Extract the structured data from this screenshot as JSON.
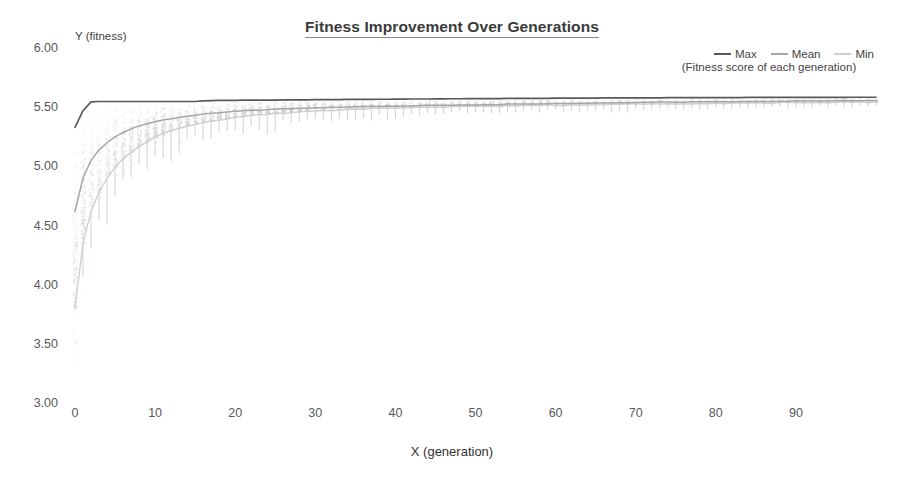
{
  "chart_data": {
    "type": "line",
    "title": "Fitness Improvement Over Generations",
    "subtitle": "(Fitness score of each generation)",
    "xlabel": "X (generation)",
    "ylabel": "Y (fitness)",
    "xlim": [
      0,
      100
    ],
    "ylim": [
      3.0,
      6.0
    ],
    "grid": false,
    "legend_position": "top-right",
    "yticks": [
      "6.00",
      "5.50",
      "5.00",
      "4.50",
      "4.00",
      "3.50",
      "3.00"
    ],
    "ytick_values": [
      6.0,
      5.5,
      5.0,
      4.5,
      4.0,
      3.5,
      3.0
    ],
    "xticks": [
      "0",
      "10",
      "20",
      "30",
      "40",
      "50",
      "60",
      "70",
      "80",
      "90"
    ],
    "xtick_values": [
      0,
      10,
      20,
      30,
      40,
      50,
      60,
      70,
      80,
      90
    ],
    "colors": {
      "max": "#595959",
      "mean": "#a6a6a6",
      "min": "#cfcfcf"
    },
    "x": [
      0,
      1,
      2,
      3,
      4,
      5,
      6,
      7,
      8,
      9,
      10,
      11,
      12,
      13,
      14,
      15,
      16,
      17,
      18,
      19,
      20,
      21,
      22,
      23,
      24,
      25,
      26,
      27,
      28,
      29,
      30,
      31,
      32,
      33,
      34,
      35,
      36,
      37,
      38,
      39,
      40,
      41,
      42,
      43,
      44,
      45,
      46,
      47,
      48,
      49,
      50,
      51,
      52,
      53,
      54,
      55,
      56,
      57,
      58,
      59,
      60,
      61,
      62,
      63,
      64,
      65,
      66,
      67,
      68,
      69,
      70,
      71,
      72,
      73,
      74,
      75,
      76,
      77,
      78,
      79,
      80,
      81,
      82,
      83,
      84,
      85,
      86,
      87,
      88,
      89,
      90,
      91,
      92,
      93,
      94,
      95,
      96,
      97,
      98,
      99,
      100
    ],
    "series": [
      {
        "name": "Max",
        "color": "#595959",
        "values": [
          5.33,
          5.47,
          5.545,
          5.548,
          5.548,
          5.548,
          5.548,
          5.548,
          5.548,
          5.548,
          5.548,
          5.548,
          5.548,
          5.548,
          5.548,
          5.548,
          5.553,
          5.556,
          5.558,
          5.558,
          5.558,
          5.559,
          5.559,
          5.559,
          5.56,
          5.56,
          5.561,
          5.561,
          5.562,
          5.562,
          5.563,
          5.563,
          5.564,
          5.564,
          5.565,
          5.565,
          5.566,
          5.566,
          5.567,
          5.567,
          5.568,
          5.568,
          5.569,
          5.569,
          5.569,
          5.57,
          5.57,
          5.571,
          5.571,
          5.572,
          5.572,
          5.572,
          5.573,
          5.573,
          5.574,
          5.574,
          5.574,
          5.575,
          5.575,
          5.575,
          5.576,
          5.576,
          5.576,
          5.577,
          5.577,
          5.577,
          5.578,
          5.578,
          5.578,
          5.578,
          5.579,
          5.579,
          5.579,
          5.579,
          5.58,
          5.58,
          5.58,
          5.58,
          5.58,
          5.581,
          5.581,
          5.581,
          5.581,
          5.581,
          5.582,
          5.582,
          5.582,
          5.582,
          5.582,
          5.582,
          5.583,
          5.583,
          5.583,
          5.583,
          5.583,
          5.583,
          5.583,
          5.584,
          5.584,
          5.584,
          5.584
        ]
      },
      {
        "name": "Mean",
        "color": "#a6a6a6",
        "values": [
          4.62,
          4.9,
          5.05,
          5.14,
          5.2,
          5.25,
          5.285,
          5.315,
          5.34,
          5.36,
          5.375,
          5.39,
          5.403,
          5.414,
          5.424,
          5.433,
          5.441,
          5.448,
          5.454,
          5.459,
          5.464,
          5.468,
          5.472,
          5.476,
          5.479,
          5.482,
          5.485,
          5.488,
          5.49,
          5.492,
          5.494,
          5.496,
          5.498,
          5.5,
          5.501,
          5.503,
          5.504,
          5.506,
          5.507,
          5.508,
          5.509,
          5.51,
          5.512,
          5.513,
          5.514,
          5.515,
          5.516,
          5.517,
          5.518,
          5.519,
          5.52,
          5.521,
          5.522,
          5.523,
          5.524,
          5.525,
          5.526,
          5.527,
          5.528,
          5.529,
          5.53,
          5.531,
          5.532,
          5.533,
          5.534,
          5.535,
          5.536,
          5.536,
          5.537,
          5.538,
          5.539,
          5.54,
          5.54,
          5.541,
          5.542,
          5.543,
          5.543,
          5.544,
          5.545,
          5.545,
          5.546,
          5.547,
          5.547,
          5.548,
          5.549,
          5.549,
          5.55,
          5.55,
          5.551,
          5.551,
          5.552,
          5.552,
          5.553,
          5.553,
          5.554,
          5.554,
          5.555,
          5.555,
          5.556,
          5.556,
          5.557
        ]
      },
      {
        "name": "Min",
        "color": "#cfcfcf",
        "values": [
          3.8,
          4.35,
          4.62,
          4.78,
          4.9,
          4.99,
          5.06,
          5.12,
          5.17,
          5.21,
          5.245,
          5.275,
          5.3,
          5.322,
          5.341,
          5.357,
          5.371,
          5.383,
          5.394,
          5.404,
          5.413,
          5.421,
          5.428,
          5.434,
          5.44,
          5.446,
          5.451,
          5.455,
          5.459,
          5.463,
          5.467,
          5.47,
          5.473,
          5.476,
          5.479,
          5.481,
          5.484,
          5.486,
          5.488,
          5.49,
          5.492,
          5.494,
          5.495,
          5.497,
          5.499,
          5.5,
          5.502,
          5.503,
          5.504,
          5.506,
          5.507,
          5.508,
          5.509,
          5.51,
          5.511,
          5.512,
          5.513,
          5.514,
          5.515,
          5.516,
          5.517,
          5.518,
          5.519,
          5.52,
          5.521,
          5.521,
          5.522,
          5.523,
          5.524,
          5.524,
          5.525,
          5.526,
          5.527,
          5.527,
          5.528,
          5.529,
          5.529,
          5.53,
          5.531,
          5.531,
          5.532,
          5.533,
          5.533,
          5.534,
          5.534,
          5.535,
          5.536,
          5.536,
          5.537,
          5.537,
          5.538,
          5.538,
          5.539,
          5.539,
          5.54,
          5.54,
          5.541,
          5.541,
          5.542,
          5.542,
          5.543
        ]
      }
    ],
    "scatter_note": "dense light-gray population scatter of per-individual fitness values between Min and Max envelopes, densest near generations 0-30"
  },
  "legend": {
    "items": [
      {
        "label": "Max",
        "color_key": "max"
      },
      {
        "label": "Mean",
        "color_key": "mean"
      },
      {
        "label": "Min",
        "color_key": "min"
      }
    ]
  }
}
